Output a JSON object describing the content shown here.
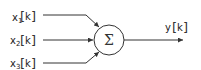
{
  "diagram": {
    "inputs": [
      {
        "var": "x",
        "sub": "1",
        "arg": "k"
      },
      {
        "var": "x",
        "sub": "2",
        "arg": "k"
      },
      {
        "var": "x",
        "sub": "3",
        "arg": "k"
      }
    ],
    "node": {
      "symbol": "Σ"
    },
    "output": {
      "var": "y",
      "arg": "k"
    }
  },
  "colors": {
    "stroke": "#333333",
    "background": "#ffffff"
  }
}
